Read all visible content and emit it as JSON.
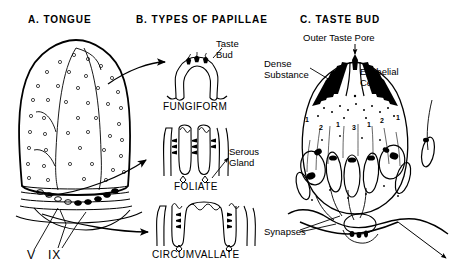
{
  "figure": {
    "background": "#ffffff",
    "ink": "#000000",
    "panels": [
      {
        "id": "a",
        "heading": "A. TONGUE"
      },
      {
        "id": "b",
        "heading": "B. TYPES OF PAPILLAE"
      },
      {
        "id": "c",
        "heading": "C. TASTE BUD"
      }
    ]
  },
  "panel_a": {
    "heading": "A. TONGUE",
    "nerve_labels": [
      {
        "name": "trigeminal",
        "text": "V"
      },
      {
        "name": "glossopharyngeal",
        "text": "IX"
      }
    ]
  },
  "panel_b": {
    "heading": "B. TYPES OF PAPILLAE",
    "papillae": [
      {
        "name": "fungiform",
        "caption": "FUNGIFORM"
      },
      {
        "name": "foliate",
        "caption": "FOLIATE"
      },
      {
        "name": "circumvallate",
        "caption": "CIRCUMVALLATE"
      }
    ],
    "callouts": [
      {
        "name": "taste-bud",
        "line1": "Taste",
        "line2": "Bud"
      },
      {
        "name": "serous-gland",
        "line1": "Serous",
        "line2": "Gland"
      }
    ]
  },
  "panel_c": {
    "heading": "C. TASTE BUD",
    "callouts": [
      {
        "name": "outer-taste-pore",
        "text": "Outer Taste Pore"
      },
      {
        "name": "dense-substance",
        "line1": "Dense",
        "line2": "Substance"
      },
      {
        "name": "epithelial-cells",
        "line1": "Epithelial",
        "line2": "Cells"
      },
      {
        "name": "synapses",
        "text": "Synapses"
      }
    ],
    "cell_numbers": [
      "1",
      "2",
      "1",
      "3",
      "1",
      "2",
      "1"
    ]
  }
}
